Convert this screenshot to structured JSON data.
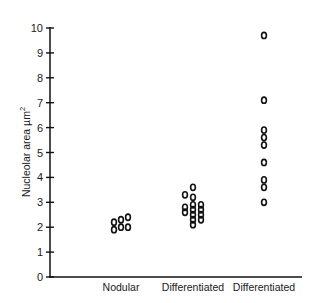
{
  "chart_data": {
    "type": "scatter",
    "title": "",
    "xlabel": "",
    "ylabel": "Nucleolar area µm²",
    "ylabel_main": "Nucleolar area µm",
    "ylabel_sup": "2",
    "ylim": [
      0,
      10
    ],
    "yticks": [
      0,
      1,
      2,
      3,
      4,
      5,
      6,
      7,
      8,
      9,
      10
    ],
    "grid": false,
    "legend": null,
    "marker": "open-oval",
    "categories": [
      "Nodular",
      "Differentiated",
      "Differentiated"
    ],
    "series": [
      {
        "name": "Nodular",
        "points": [
          {
            "dx": -7,
            "y": 2.2
          },
          {
            "dx": 0,
            "y": 2.3
          },
          {
            "dx": 7,
            "y": 2.4
          },
          {
            "dx": -7,
            "y": 1.9
          },
          {
            "dx": 0,
            "y": 2.0
          },
          {
            "dx": 7,
            "y": 2.0
          }
        ]
      },
      {
        "name": "Differentiated",
        "points": [
          {
            "dx": 0,
            "y": 3.6
          },
          {
            "dx": 0,
            "y": 3.2
          },
          {
            "dx": 0,
            "y": 2.9
          },
          {
            "dx": 0,
            "y": 2.7
          },
          {
            "dx": 0,
            "y": 2.5
          },
          {
            "dx": 0,
            "y": 2.3
          },
          {
            "dx": 0,
            "y": 2.1
          },
          {
            "dx": -8,
            "y": 3.3
          },
          {
            "dx": -8,
            "y": 2.8
          },
          {
            "dx": -8,
            "y": 2.6
          },
          {
            "dx": 8,
            "y": 2.9
          },
          {
            "dx": 8,
            "y": 2.7
          },
          {
            "dx": 8,
            "y": 2.5
          },
          {
            "dx": 8,
            "y": 2.3
          }
        ]
      },
      {
        "name": "Differentiated",
        "points": [
          {
            "dx": 0,
            "y": 9.7
          },
          {
            "dx": 0,
            "y": 7.1
          },
          {
            "dx": 0,
            "y": 5.9
          },
          {
            "dx": 0,
            "y": 5.6
          },
          {
            "dx": 0,
            "y": 5.3
          },
          {
            "dx": 0,
            "y": 4.6
          },
          {
            "dx": 0,
            "y": 3.9
          },
          {
            "dx": 0,
            "y": 3.6
          },
          {
            "dx": 0,
            "y": 3.0
          }
        ]
      }
    ]
  }
}
